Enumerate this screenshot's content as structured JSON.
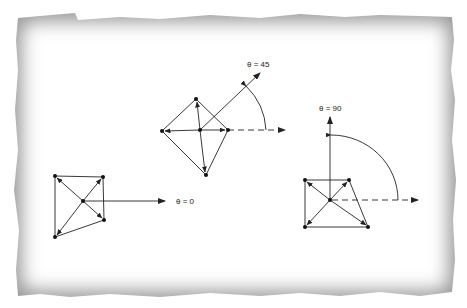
{
  "figure": {
    "background": "#ffffff",
    "frame": {
      "style": "torn-paper vignette border",
      "outer_color": "#8a8a8a",
      "inner_color": "#ffffff"
    },
    "panels": [
      {
        "id": "theta-0",
        "label": "θ = 0",
        "angle_deg": 0,
        "center": [
          83,
          201
        ],
        "nodes": [
          [
            55,
            176
          ],
          [
            103,
            177
          ],
          [
            104,
            220
          ],
          [
            55,
            237
          ]
        ],
        "direction_arrow_end": [
          165,
          201
        ],
        "label_pos": [
          176,
          204
        ]
      },
      {
        "id": "theta-45",
        "label": "θ = 45",
        "angle_deg": 45,
        "center": [
          200,
          130
        ],
        "nodes": [
          [
            196,
            99
          ],
          [
            162,
            131
          ],
          [
            228,
            130
          ],
          [
            206,
            175
          ]
        ],
        "direction_arrow_end": [
          260,
          73
        ],
        "reference_dashed_end": [
          285,
          130
        ],
        "label_pos": [
          247,
          67
        ]
      },
      {
        "id": "theta-90",
        "label": "θ = 90",
        "angle_deg": 90,
        "center": [
          330,
          200
        ],
        "nodes": [
          [
            305,
            180
          ],
          [
            349,
            180
          ],
          [
            368,
            227
          ],
          [
            305,
            227
          ]
        ],
        "direction_arrow_end": [
          330,
          117
        ],
        "reference_dashed_end": [
          418,
          200
        ],
        "label_pos": [
          319,
          111
        ]
      }
    ]
  }
}
